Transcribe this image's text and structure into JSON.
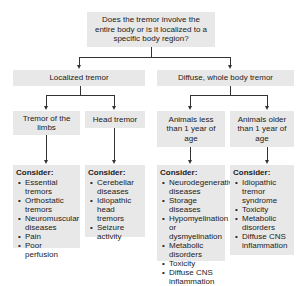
{
  "root": {
    "question": "Does the tremor involve the entire body or is it localized to a specific body region?"
  },
  "branches": [
    {
      "label": "Localized tremor",
      "children": [
        {
          "label": "Tremor of the limbs",
          "consider": {
            "heading": "Consider:",
            "items": [
              "Essential tremors",
              "Orthostatic tremors",
              "Neuromuscular diseases",
              "Pain",
              "Poor perfusion"
            ]
          }
        },
        {
          "label": "Head tremor",
          "consider": {
            "heading": "Consider:",
            "items": [
              "Cerebellar diseases",
              "Idiopathic head tremors",
              "Seizure activity"
            ]
          }
        }
      ]
    },
    {
      "label": "Diffuse, whole body tremor",
      "children": [
        {
          "label": "Animals less than 1 year of age",
          "consider": {
            "heading": "Consider:",
            "items": [
              "Neurodegenerative diseases",
              "Storage diseases",
              "Hypomyelination or dysmyelination",
              "Metabolic disorders",
              "Toxicity",
              "Diffuse CNS inflammation"
            ]
          }
        },
        {
          "label": "Animals older than 1 year of age",
          "consider": {
            "heading": "Consider:",
            "items": [
              "Idiopathic tremor syndrome",
              "Toxicity",
              "Metabolic disorders",
              "Diffuse CNS inflammation"
            ]
          }
        }
      ]
    }
  ],
  "colors": {
    "box_fill": "#e8e8e8",
    "line": "#333333",
    "text": "#222222"
  }
}
